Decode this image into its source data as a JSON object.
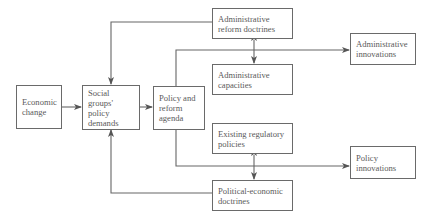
{
  "diagram": {
    "nodes": {
      "economic_change": {
        "label_1": "Economic",
        "label_2": "change"
      },
      "social_groups": {
        "label_1": "Social groups'",
        "label_2": "policy",
        "label_3": "demands"
      },
      "policy_agenda": {
        "label_1": "Policy and",
        "label_2": "reform",
        "label_3": "agenda"
      },
      "admin_reform_doctrines": {
        "label_1": "Administrative",
        "label_2": "reform doctrines"
      },
      "admin_capacities": {
        "label_1": "Administrative",
        "label_2": "capacities"
      },
      "admin_innovations": {
        "label_1": "Administrative",
        "label_2": "innovations"
      },
      "existing_regulatory": {
        "label_1": "Existing regulatory",
        "label_2": "policies"
      },
      "political_economic": {
        "label_1": "Political-economic",
        "label_2": "doctrines"
      },
      "policy_innovations": {
        "label_1": "Policy",
        "label_2": "innovations"
      }
    },
    "edges": [
      {
        "from": "Economic change",
        "to": "Social groups' policy demands"
      },
      {
        "from": "Social groups' policy demands",
        "to": "Policy and reform agenda"
      },
      {
        "from": "Administrative reform doctrines",
        "to": "Social groups' policy demands"
      },
      {
        "from": "Political-economic doctrines",
        "to": "Social groups' policy demands"
      },
      {
        "from": "Policy and reform agenda",
        "to": "Administrative innovations"
      },
      {
        "from": "Policy and reform agenda",
        "to": "Policy innovations"
      },
      {
        "from": "Administrative reform doctrines",
        "to": "Administrative capacities",
        "bidirectional": true
      },
      {
        "from": "Existing regulatory policies",
        "to": "Political-economic doctrines",
        "bidirectional": true
      }
    ]
  }
}
